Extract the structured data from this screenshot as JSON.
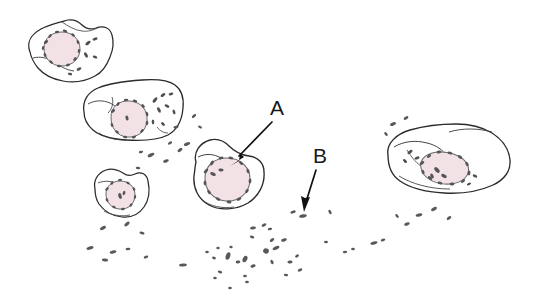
{
  "figure": {
    "background_color": "#ffffff",
    "outline_color": "#2b2b2b",
    "nucleus_fill_color": "#f2e2e6",
    "nucleus_edge_color": "#5a5a5a",
    "bacteria_color": "#58585c"
  },
  "annotations": [
    {
      "id": "label-a",
      "text": "A",
      "x": 277,
      "y": 115,
      "description": "arrow pointing down-left to a host cell",
      "arrow": {
        "x1": 272,
        "y1": 122,
        "x2": 232,
        "y2": 163
      }
    },
    {
      "id": "label-b",
      "text": "B",
      "x": 320,
      "y": 163,
      "description": "arrow pointing down to an extracellular bacterium",
      "arrow": {
        "x1": 316,
        "y1": 170,
        "x2": 305,
        "y2": 209
      }
    }
  ],
  "cells": [
    {
      "id": "cell-top-left",
      "label": "host cell with pink nucleus, upper left"
    },
    {
      "id": "cell-upper-mid",
      "label": "elongated host cell with pink nucleus, upper middle"
    },
    {
      "id": "cell-small-left",
      "label": "small host cell with pink nucleus, left"
    },
    {
      "id": "cell-labeled-a",
      "label": "host cell indicated by label A"
    },
    {
      "id": "cell-right",
      "label": "large flattened host cell with pink nucleus, right"
    }
  ],
  "bacteria": {
    "label": "scattered rod-shaped bacteria",
    "count_visible": 62
  }
}
